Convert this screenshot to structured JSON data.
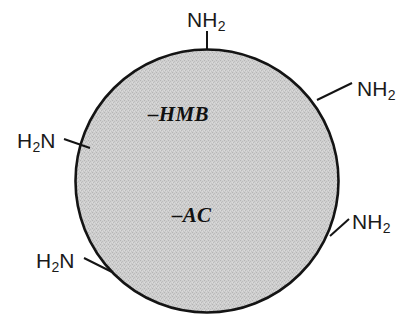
{
  "figure": {
    "kind": "chemical-structure-diagram",
    "subject": "resin-bead-with-amine-groups",
    "bead": {
      "shape": "circle",
      "fill_color": "#c9c9c9",
      "fill_texture": "dither-halftone",
      "outline_color": "#141414",
      "background_color": "#ffffff",
      "center_x": 207,
      "center_y": 181,
      "radius": 132
    },
    "linker_labels": [
      {
        "id": "hmb",
        "text": "–HMB"
      },
      {
        "id": "ac",
        "text": "–AC"
      }
    ],
    "amine_labels": [
      {
        "id": "top",
        "element": "N",
        "hydrogens": "2",
        "order": "NH2",
        "n_text": "NH",
        "h_text": "H",
        "sub": "2",
        "position": "top"
      },
      {
        "id": "upper-right",
        "element": "N",
        "hydrogens": "2",
        "order": "NH2",
        "n_text": "NH",
        "h_text": "H",
        "sub": "2",
        "position": "upper-right"
      },
      {
        "id": "lower-right",
        "element": "N",
        "hydrogens": "2",
        "order": "NH2",
        "n_text": "NH",
        "h_text": "H",
        "sub": "2",
        "position": "lower-right"
      },
      {
        "id": "left",
        "element": "N",
        "hydrogens": "2",
        "order": "H2N",
        "n_text": "N",
        "h_text": "H",
        "sub": "2",
        "position": "left"
      },
      {
        "id": "lower-left",
        "element": "N",
        "hydrogens": "2",
        "order": "H2N",
        "n_text": "N",
        "h_text": "H",
        "sub": "2",
        "position": "lower-left"
      }
    ],
    "tick_color": "#141414",
    "amine_count": 5
  }
}
